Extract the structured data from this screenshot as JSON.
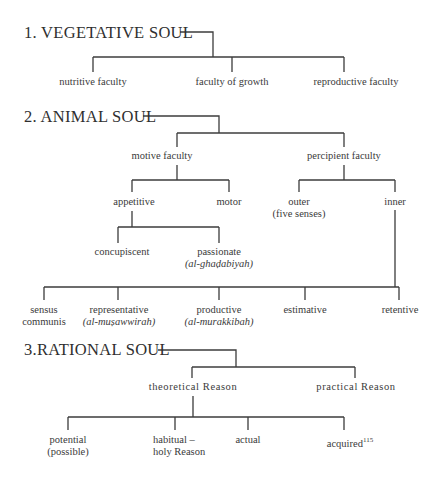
{
  "top_cutoff_text": "pp",
  "sections": {
    "vegetative": {
      "title": "1. VEGETATIVE SOUL",
      "children": [
        {
          "label": "nutritive faculty"
        },
        {
          "label": "faculty of growth"
        },
        {
          "label": "reproductive faculty"
        }
      ]
    },
    "animal": {
      "title": "2. ANIMAL SOUL",
      "motive": {
        "label": "motive faculty",
        "appetitive": {
          "label": "appetitive",
          "concupiscent": {
            "label": "concupiscent"
          },
          "passionate": {
            "label": "passionate",
            "arabic": "(al-ghaḍabiyah)"
          }
        },
        "motor": {
          "label": "motor"
        }
      },
      "percipient": {
        "label": "percipient faculty",
        "outer": {
          "label": "outer",
          "note": "(five senses)"
        },
        "inner": {
          "label": "inner",
          "children": [
            {
              "label": "sensus",
              "line2": "communis"
            },
            {
              "label": "representative",
              "arabic": "(al-muṣawwirah)"
            },
            {
              "label": "productive",
              "arabic": "(al-murakkibah)"
            },
            {
              "label": "estimative"
            },
            {
              "label": "retentive"
            }
          ]
        }
      }
    },
    "rational": {
      "title": "3.RATIONAL SOUL",
      "theoretical": {
        "label": "theoretical Reason",
        "children": [
          {
            "label": "potential",
            "line2": "(possible)"
          },
          {
            "label": "habitual –",
            "line2": "holy Reason"
          },
          {
            "label": "actual"
          },
          {
            "label": "acquired",
            "footnote": "115"
          }
        ]
      },
      "practical": {
        "label": "practical Reason"
      }
    }
  },
  "colors": {
    "line": "#3c3c3c",
    "text": "#3a3a3a",
    "background": "#ffffff"
  }
}
